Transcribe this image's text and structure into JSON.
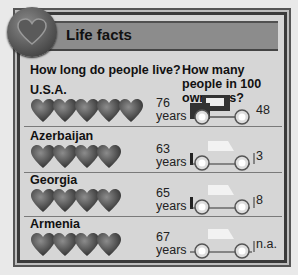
{
  "header": {
    "title": "Life facts",
    "icon": "heart-icon"
  },
  "columns": {
    "left": "How long do people live?",
    "right": "How many people in 100 own cars?"
  },
  "years_unit": "years",
  "rows": [
    {
      "country": "U.S.A.",
      "life_expectancy": "76",
      "hearts": 5,
      "cars": "48",
      "car_style": "full"
    },
    {
      "country": "Azerbaijan",
      "life_expectancy": "63",
      "hearts": 4,
      "cars": "3",
      "car_style": "outline"
    },
    {
      "country": "Georgia",
      "life_expectancy": "65",
      "hearts": 4,
      "cars": "8",
      "car_style": "outline"
    },
    {
      "country": "Armenia",
      "life_expectancy": "67",
      "hearts": 4,
      "cars": "n.a.",
      "car_style": "wheels-only"
    }
  ],
  "chart_data": {
    "type": "table",
    "title": "Life facts",
    "columns": [
      "Country",
      "Life expectancy (years)",
      "Car owners per 100 people"
    ],
    "categories": [
      "U.S.A.",
      "Azerbaijan",
      "Georgia",
      "Armenia"
    ],
    "series": [
      {
        "name": "How long do people live? (years)",
        "values": [
          76,
          63,
          65,
          67
        ]
      },
      {
        "name": "How many people in 100 own cars?",
        "values": [
          48,
          3,
          8,
          null
        ]
      }
    ],
    "annotations": [
      "Armenia car ownership: n.a."
    ]
  }
}
